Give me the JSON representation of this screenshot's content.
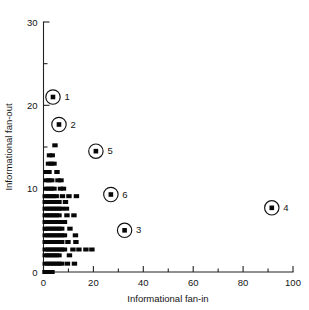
{
  "chart_data": {
    "type": "scatter",
    "title": "",
    "xlabel": "Informational fan-in",
    "ylabel": "Informational fan-out",
    "xlim": [
      0,
      100
    ],
    "ylim": [
      0,
      30
    ],
    "grid": false,
    "legend": false,
    "x_ticks_major": [
      0,
      20,
      40,
      60,
      80,
      100
    ],
    "x_ticks_major_labels": [
      "0",
      "20",
      "40",
      "60",
      "80",
      "100"
    ],
    "x_ticks_minor": [
      10,
      30,
      50,
      70,
      90
    ],
    "y_ticks_major": [
      0,
      10,
      20,
      30
    ],
    "y_ticks_major_labels": [
      "0",
      "10",
      "20",
      "30"
    ],
    "y_ticks_minor": [
      5,
      15,
      25
    ],
    "marker": "filled-square",
    "highlighted_points": [
      {
        "label": "1",
        "x": 3.8,
        "y": 21.0
      },
      {
        "label": "2",
        "x": 6.2,
        "y": 17.7
      },
      {
        "label": "5",
        "x": 21.0,
        "y": 14.5
      },
      {
        "label": "6",
        "x": 27.0,
        "y": 9.3
      },
      {
        "label": "3",
        "x": 32.5,
        "y": 5.0
      },
      {
        "label": "4",
        "x": 91.5,
        "y": 7.7
      }
    ],
    "points": [
      {
        "x": 0.6,
        "y": 0.0
      },
      {
        "x": 2.1,
        "y": 0.0
      },
      {
        "x": 3.4,
        "y": 0.0
      },
      {
        "x": 0.7,
        "y": 1.0
      },
      {
        "x": 1.8,
        "y": 1.0
      },
      {
        "x": 2.9,
        "y": 1.0
      },
      {
        "x": 4.0,
        "y": 1.0
      },
      {
        "x": 5.1,
        "y": 1.0
      },
      {
        "x": 6.2,
        "y": 1.0
      },
      {
        "x": 7.3,
        "y": 1.0
      },
      {
        "x": 9.6,
        "y": 1.0
      },
      {
        "x": 12.4,
        "y": 1.0
      },
      {
        "x": 0.7,
        "y": 2.0
      },
      {
        "x": 1.8,
        "y": 2.0
      },
      {
        "x": 2.9,
        "y": 2.0
      },
      {
        "x": 4.0,
        "y": 2.0
      },
      {
        "x": 5.1,
        "y": 2.0
      },
      {
        "x": 6.2,
        "y": 2.0
      },
      {
        "x": 10.4,
        "y": 2.0
      },
      {
        "x": 0.7,
        "y": 2.7
      },
      {
        "x": 1.8,
        "y": 2.7
      },
      {
        "x": 2.9,
        "y": 2.7
      },
      {
        "x": 4.0,
        "y": 2.7
      },
      {
        "x": 5.1,
        "y": 2.7
      },
      {
        "x": 6.2,
        "y": 2.7
      },
      {
        "x": 7.3,
        "y": 2.7
      },
      {
        "x": 8.4,
        "y": 2.7
      },
      {
        "x": 11.8,
        "y": 2.7
      },
      {
        "x": 14.2,
        "y": 2.7
      },
      {
        "x": 17.0,
        "y": 2.7
      },
      {
        "x": 19.4,
        "y": 2.7
      },
      {
        "x": 0.7,
        "y": 3.6
      },
      {
        "x": 1.8,
        "y": 3.6
      },
      {
        "x": 2.9,
        "y": 3.6
      },
      {
        "x": 4.0,
        "y": 3.6
      },
      {
        "x": 5.1,
        "y": 3.6
      },
      {
        "x": 6.2,
        "y": 3.6
      },
      {
        "x": 7.3,
        "y": 3.6
      },
      {
        "x": 9.8,
        "y": 3.6
      },
      {
        "x": 13.0,
        "y": 3.6
      },
      {
        "x": 0.7,
        "y": 4.4
      },
      {
        "x": 1.8,
        "y": 4.4
      },
      {
        "x": 2.9,
        "y": 4.4
      },
      {
        "x": 4.0,
        "y": 4.4
      },
      {
        "x": 5.1,
        "y": 4.4
      },
      {
        "x": 6.2,
        "y": 4.4
      },
      {
        "x": 7.3,
        "y": 4.4
      },
      {
        "x": 8.4,
        "y": 4.4
      },
      {
        "x": 12.8,
        "y": 4.4
      },
      {
        "x": 0.7,
        "y": 5.2
      },
      {
        "x": 1.8,
        "y": 5.2
      },
      {
        "x": 2.9,
        "y": 5.2
      },
      {
        "x": 4.0,
        "y": 5.2
      },
      {
        "x": 5.1,
        "y": 5.2
      },
      {
        "x": 6.2,
        "y": 5.2
      },
      {
        "x": 7.3,
        "y": 5.2
      },
      {
        "x": 10.6,
        "y": 5.2
      },
      {
        "x": 0.7,
        "y": 6.0
      },
      {
        "x": 1.8,
        "y": 6.0
      },
      {
        "x": 2.9,
        "y": 6.0
      },
      {
        "x": 4.0,
        "y": 6.0
      },
      {
        "x": 5.1,
        "y": 6.0
      },
      {
        "x": 6.2,
        "y": 6.0
      },
      {
        "x": 7.3,
        "y": 6.0
      },
      {
        "x": 8.4,
        "y": 6.0
      },
      {
        "x": 0.7,
        "y": 6.8
      },
      {
        "x": 1.8,
        "y": 6.8
      },
      {
        "x": 2.9,
        "y": 6.8
      },
      {
        "x": 4.0,
        "y": 6.8
      },
      {
        "x": 5.1,
        "y": 6.8
      },
      {
        "x": 6.2,
        "y": 6.8
      },
      {
        "x": 9.4,
        "y": 6.8
      },
      {
        "x": 12.2,
        "y": 6.8
      },
      {
        "x": 0.7,
        "y": 7.6
      },
      {
        "x": 1.8,
        "y": 7.6
      },
      {
        "x": 2.9,
        "y": 7.6
      },
      {
        "x": 4.0,
        "y": 7.6
      },
      {
        "x": 5.1,
        "y": 7.6
      },
      {
        "x": 6.2,
        "y": 7.6
      },
      {
        "x": 7.3,
        "y": 7.6
      },
      {
        "x": 9.2,
        "y": 7.6
      },
      {
        "x": 0.7,
        "y": 8.4
      },
      {
        "x": 1.8,
        "y": 8.4
      },
      {
        "x": 2.9,
        "y": 8.4
      },
      {
        "x": 4.0,
        "y": 8.4
      },
      {
        "x": 5.1,
        "y": 8.4
      },
      {
        "x": 6.2,
        "y": 8.4
      },
      {
        "x": 8.8,
        "y": 8.4
      },
      {
        "x": 0.7,
        "y": 9.1
      },
      {
        "x": 1.8,
        "y": 9.1
      },
      {
        "x": 2.9,
        "y": 9.1
      },
      {
        "x": 4.0,
        "y": 9.1
      },
      {
        "x": 5.1,
        "y": 9.1
      },
      {
        "x": 7.6,
        "y": 9.1
      },
      {
        "x": 10.2,
        "y": 9.1
      },
      {
        "x": 13.2,
        "y": 9.1
      },
      {
        "x": 0.9,
        "y": 10.0
      },
      {
        "x": 2.0,
        "y": 10.0
      },
      {
        "x": 3.1,
        "y": 10.0
      },
      {
        "x": 4.2,
        "y": 10.0
      },
      {
        "x": 6.8,
        "y": 10.0
      },
      {
        "x": 8.0,
        "y": 10.0
      },
      {
        "x": 1.1,
        "y": 11.0
      },
      {
        "x": 2.2,
        "y": 11.0
      },
      {
        "x": 3.3,
        "y": 11.0
      },
      {
        "x": 5.8,
        "y": 11.0
      },
      {
        "x": 7.0,
        "y": 11.0
      },
      {
        "x": 1.1,
        "y": 12.0
      },
      {
        "x": 2.2,
        "y": 12.0
      },
      {
        "x": 5.4,
        "y": 12.0
      },
      {
        "x": 2.0,
        "y": 13.0
      },
      {
        "x": 3.1,
        "y": 13.0
      },
      {
        "x": 4.2,
        "y": 13.0
      },
      {
        "x": 2.4,
        "y": 14.0
      },
      {
        "x": 3.5,
        "y": 14.0
      },
      {
        "x": 4.6,
        "y": 15.2
      }
    ]
  },
  "axis": {
    "x_title": "Informational fan-in",
    "y_title": "Informational fan-out"
  }
}
